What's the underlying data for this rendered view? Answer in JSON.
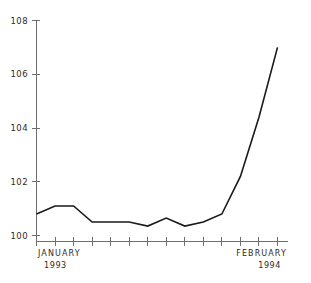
{
  "chart_data": {
    "type": "line",
    "title": "",
    "subtitle": "",
    "xlabel": "",
    "ylabel": "",
    "ylim": [
      99.3,
      108.2
    ],
    "yticks": [
      100,
      102,
      104,
      106,
      108
    ],
    "ytick_labels": [
      "100",
      "102",
      "104",
      "106",
      "108"
    ],
    "grid": false,
    "legend": false,
    "legend_position": "none",
    "x_tick_count": 14,
    "x": [
      1,
      2,
      3,
      4,
      5,
      6,
      7,
      8,
      9,
      10,
      11,
      12,
      13,
      14
    ],
    "categories": [
      "JANUARY 1993",
      "",
      "",
      "",
      "",
      "",
      "",
      "",
      "",
      "",
      "",
      "",
      "",
      "FEBRUARY 1994"
    ],
    "values": [
      100.8,
      101.1,
      101.1,
      100.5,
      100.5,
      100.5,
      100.35,
      100.65,
      100.35,
      100.5,
      100.8,
      102.2,
      104.4,
      107.0
    ],
    "series": [
      {
        "name": "index",
        "values": [
          100.8,
          101.1,
          101.1,
          100.5,
          100.5,
          100.5,
          100.35,
          100.65,
          100.35,
          100.5,
          100.8,
          102.2,
          104.4,
          107.0
        ],
        "color": "#1a1a1a"
      }
    ],
    "x_axis_labels": [
      {
        "text": "JANUARY",
        "year": "1993",
        "position": "start"
      },
      {
        "text": "FEBRUARY",
        "year": "1994",
        "position": "end"
      }
    ]
  },
  "axis": {
    "y_tick_labels": [
      "108",
      "106",
      "104",
      "102",
      "100"
    ],
    "x_start_label": "JANUARY",
    "x_start_year": "1993",
    "x_end_label": "FEBRUARY",
    "x_end_year": "1994"
  },
  "colors": {
    "line": "#1a1a1a",
    "axis": "#6f6f6f",
    "text": "#2b2b2b",
    "background": "#ffffff"
  }
}
